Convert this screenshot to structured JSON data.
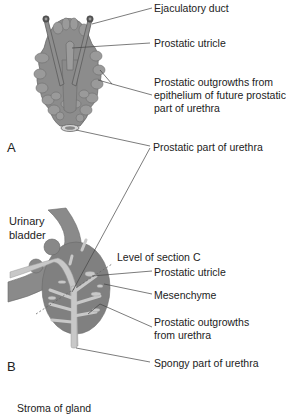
{
  "panels": {
    "a": "A",
    "b": "B"
  },
  "panel_a": {
    "labels": {
      "ejaculatory_duct": "Ejaculatory duct",
      "prostatic_utricle": "Prostatic utricle",
      "outgrowths_line1": "Prostatic outgrowths from",
      "outgrowths_line2": "epithelium of future prostatic",
      "outgrowths_line3": "part of urethra",
      "prostatic_part_urethra": "Prostatic part of urethra"
    }
  },
  "panel_b": {
    "organ": {
      "line1": "Urinary",
      "line2": "bladder"
    },
    "labels": {
      "level_section_c": "Level of section C",
      "prostatic_utricle": "Prostatic utricle",
      "mesenchyme": "Mesenchyme",
      "outgrowths_line1": "Prostatic outgrowths",
      "outgrowths_line2": "from urethra",
      "spongy_part_urethra": "Spongy part of urethra"
    }
  },
  "panel_c": {
    "labels": {
      "stroma": "Stroma of gland"
    }
  },
  "colors": {
    "tissue_dark": "#7a7a7a",
    "tissue_mid": "#8c8c8c",
    "tissue_light": "#a8a8a8",
    "urethra_light": "#c8c8c8",
    "leader_line": "#444444"
  }
}
